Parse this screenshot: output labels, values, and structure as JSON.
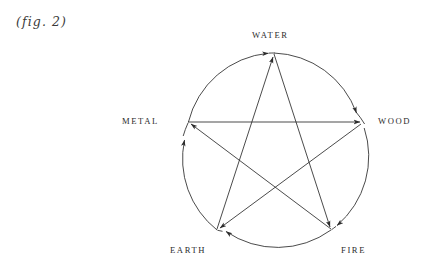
{
  "figure": {
    "caption": "(fig. 2)",
    "stroke_color": "#2b2b2b",
    "background_color": "#ffffff"
  },
  "diagram": {
    "type": "cycle-diagram",
    "shape": "circle-with-inscribed-pentagram",
    "center": {
      "x": 274,
      "y": 144
    },
    "radius": 91,
    "nodes": [
      {
        "id": "water",
        "label": "WATER",
        "x": 274,
        "y": 53,
        "position": "top"
      },
      {
        "id": "wood",
        "label": "WOOD",
        "x": 360,
        "y": 122,
        "position": "right"
      },
      {
        "id": "fire",
        "label": "FIRE",
        "x": 331,
        "y": 230,
        "position": "bottom-right"
      },
      {
        "id": "earth",
        "label": "EARTH",
        "x": 217,
        "y": 230,
        "position": "bottom-left"
      },
      {
        "id": "metal",
        "label": "METAL",
        "x": 188,
        "y": 122,
        "position": "left"
      }
    ],
    "outer_cycle": {
      "name": "generating cycle",
      "direction": "clockwise",
      "edges": [
        {
          "from": "metal",
          "to": "water"
        },
        {
          "from": "water",
          "to": "wood"
        },
        {
          "from": "wood",
          "to": "fire"
        },
        {
          "from": "fire",
          "to": "earth"
        },
        {
          "from": "earth",
          "to": "metal"
        }
      ]
    },
    "inner_cycle": {
      "name": "overcoming cycle",
      "shape": "pentagram",
      "edges": [
        {
          "from": "water",
          "to": "fire"
        },
        {
          "from": "fire",
          "to": "metal"
        },
        {
          "from": "metal",
          "to": "wood"
        },
        {
          "from": "wood",
          "to": "earth"
        },
        {
          "from": "earth",
          "to": "water"
        }
      ]
    }
  }
}
